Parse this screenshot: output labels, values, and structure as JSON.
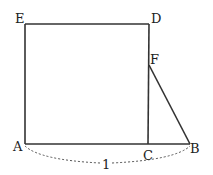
{
  "figure": {
    "points": {
      "A": "A",
      "B": "B",
      "C": "C",
      "D": "D",
      "E": "E",
      "F": "F"
    },
    "length_label": "1"
  }
}
